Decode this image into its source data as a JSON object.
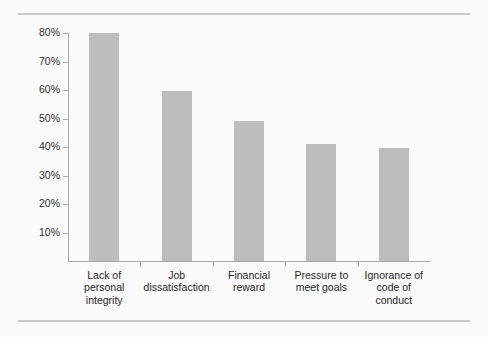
{
  "chart_data": {
    "type": "bar",
    "title": "",
    "subtitle": "",
    "xlabel": "",
    "ylabel": "",
    "categories": [
      "Lack of personal integrity",
      "Job dissatisfaction",
      "Financial reward",
      "Pressure to meet goals",
      "Ignorance of code of conduct"
    ],
    "category_lines": [
      [
        "Lack of",
        "personal",
        "integrity"
      ],
      [
        "Job",
        "dissatisfaction"
      ],
      [
        "Financial",
        "reward"
      ],
      [
        "Pressure to",
        "meet goals"
      ],
      [
        "Ignorance of",
        "code of",
        "conduct"
      ]
    ],
    "values": [
      80,
      59.5,
      49,
      41,
      39.5
    ],
    "value_labels": [
      "80%",
      "60%",
      "49%",
      "41%",
      "40%"
    ],
    "ylim": [
      0,
      80
    ],
    "ytick_values": [
      10,
      20,
      30,
      40,
      50,
      60,
      70,
      80
    ],
    "ytick_labels": [
      "10%",
      "20%",
      "30%",
      "40%",
      "50%",
      "60%",
      "70%",
      "80%"
    ],
    "grid": false,
    "legend": false,
    "legend_position": "none",
    "bar_color": "#bdbdbd",
    "axis_color": "#a8a8a8",
    "background_color": "#fbfbfb",
    "rule_color": "#c9c9c9"
  }
}
